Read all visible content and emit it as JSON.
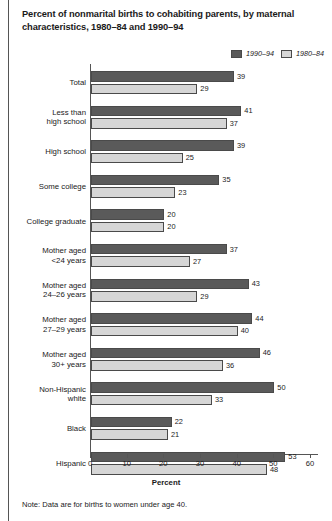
{
  "title": "Percent of nonmarital births to cohabiting parents, by maternal characteristics, 1980–84 and 1990–94",
  "note": "Note: Data are for births to women under age 40.",
  "legend": {
    "series1_label": "1990–94",
    "series2_label": "1980–84",
    "series1_color": "#5a5a5a",
    "series2_color": "#d6d6d6"
  },
  "chart_data": {
    "type": "bar",
    "orientation": "horizontal",
    "title": "Percent of nonmarital births to cohabiting parents, by maternal characteristics, 1980–84 and 1990–94",
    "xlabel": "Percent",
    "ylabel": "",
    "xlim": [
      0,
      60
    ],
    "xticks": [
      0,
      10,
      20,
      30,
      40,
      50,
      60
    ],
    "grid": false,
    "legend_position": "top-right",
    "categories": [
      "Total",
      "Less than high school",
      "High school",
      "Some college",
      "College graduate",
      "Mother aged <24 years",
      "Mother aged 24–26 years",
      "Mother aged 27–29 years",
      "Mother aged 30+ years",
      "Non-Hispanic white",
      "Black",
      "Hispanic"
    ],
    "category_lines": [
      [
        "Total"
      ],
      [
        "Less than",
        "high school"
      ],
      [
        "High school"
      ],
      [
        "Some college"
      ],
      [
        "College graduate"
      ],
      [
        "Mother aged",
        "<24 years"
      ],
      [
        "Mother aged",
        "24–26 years"
      ],
      [
        "Mother aged",
        "27–29 years"
      ],
      [
        "Mother aged",
        "30+ years"
      ],
      [
        "Non-Hispanic",
        "white"
      ],
      [
        "Black"
      ],
      [
        "Hispanic"
      ]
    ],
    "series": [
      {
        "name": "1990–94",
        "color": "#5a5a5a",
        "values": [
          39,
          41,
          39,
          35,
          20,
          37,
          43,
          44,
          46,
          50,
          22,
          53
        ]
      },
      {
        "name": "1980–84",
        "color": "#d6d6d6",
        "values": [
          29,
          37,
          25,
          23,
          20,
          27,
          29,
          40,
          36,
          33,
          21,
          48
        ]
      }
    ],
    "annotation": "Note: Data are for births to women under age 40."
  }
}
